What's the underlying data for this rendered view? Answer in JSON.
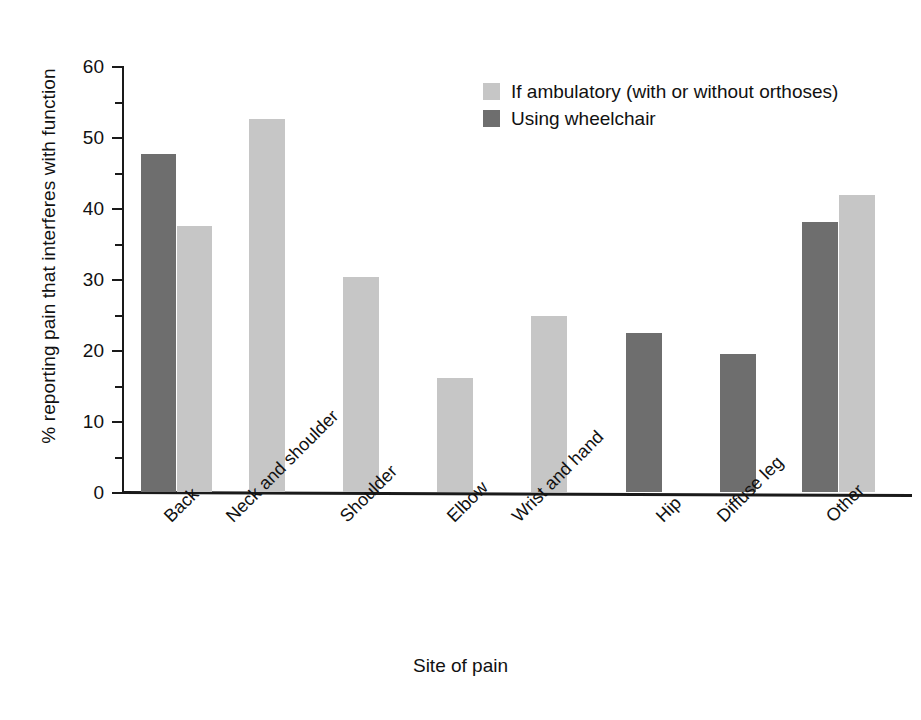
{
  "chart_data": {
    "type": "bar",
    "title": "",
    "xlabel": "Site of pain",
    "ylabel": "% reporting pain that interferes with function",
    "ylim": [
      0,
      60
    ],
    "yticks": [
      0,
      10,
      20,
      30,
      40,
      50,
      60
    ],
    "yticks_minor": [
      5,
      15,
      25,
      35,
      45,
      55
    ],
    "grid": false,
    "legend_position": "top-right",
    "categories": [
      "Back",
      "Neck and shoulder",
      "Shoulder",
      "Elbow",
      "Wrist and hand",
      "Hip",
      "Diffuse leg",
      "Other"
    ],
    "series": [
      {
        "name": "If ambulatory (with or without orthoses)",
        "color": "#c6c6c6",
        "values": [
          37.5,
          52.5,
          30.3,
          16.0,
          24.8,
          null,
          null,
          41.8
        ]
      },
      {
        "name": "Using wheelchair",
        "color": "#6e6e6e",
        "values": [
          47.6,
          null,
          null,
          null,
          null,
          22.4,
          19.4,
          38.1
        ]
      }
    ]
  },
  "legend": {
    "items": [
      {
        "label": "If ambulatory (with or without orthoses)",
        "swatch": "light"
      },
      {
        "label": "Using wheelchair",
        "swatch": "dark"
      }
    ]
  },
  "axis": {
    "y_title": "% reporting pain that interferes with function",
    "x_title": "Site of pain",
    "y_tick_labels": [
      "60",
      "50",
      "40",
      "30",
      "20",
      "10",
      "0"
    ]
  },
  "bars": [
    {
      "name": "back-wheelchair",
      "series": "Using wheelchair",
      "category": "Back",
      "value": 47.6,
      "style": "dark",
      "x": 19,
      "w": 35
    },
    {
      "name": "back-ambulatory",
      "series": "If ambulatory (with or without orthoses)",
      "category": "Back",
      "value": 37.5,
      "style": "light",
      "x": 55,
      "w": 35
    },
    {
      "name": "neck-and-shoulder-ambulatory",
      "series": "If ambulatory (with or without orthoses)",
      "category": "Neck and shoulder",
      "value": 52.5,
      "style": "light",
      "x": 127,
      "w": 36
    },
    {
      "name": "shoulder-ambulatory",
      "series": "If ambulatory (with or without orthoses)",
      "category": "Shoulder",
      "value": 30.3,
      "style": "light",
      "x": 221,
      "w": 36
    },
    {
      "name": "elbow-ambulatory",
      "series": "If ambulatory (with or without orthoses)",
      "category": "Elbow",
      "value": 16.0,
      "style": "light",
      "x": 315,
      "w": 36
    },
    {
      "name": "wrist-and-hand-ambulatory",
      "series": "If ambulatory (with or without orthoses)",
      "category": "Wrist and hand",
      "value": 24.8,
      "style": "light",
      "x": 409,
      "w": 36
    },
    {
      "name": "hip-wheelchair",
      "series": "Using wheelchair",
      "category": "Hip",
      "value": 22.4,
      "style": "dark",
      "x": 504,
      "w": 36
    },
    {
      "name": "diffuse-leg-wheelchair",
      "series": "Using wheelchair",
      "category": "Diffuse leg",
      "value": 19.4,
      "style": "dark",
      "x": 598,
      "w": 36
    },
    {
      "name": "other-wheelchair",
      "series": "Using wheelchair",
      "category": "Other",
      "value": 38.1,
      "style": "dark",
      "x": 680,
      "w": 36
    },
    {
      "name": "other-ambulatory",
      "series": "If ambulatory (with or without orthoses)",
      "category": "Other",
      "value": 41.8,
      "style": "light",
      "x": 717,
      "w": 36
    }
  ],
  "cat_label_x": [
    160,
    222,
    336,
    443,
    508,
    652,
    713,
    822
  ]
}
